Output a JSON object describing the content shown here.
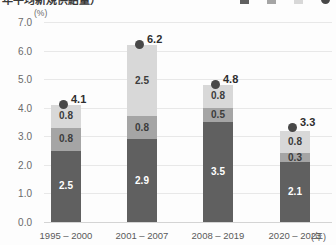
{
  "header": {
    "title_partial": "年平均新規供給量）",
    "unit_label": "(%)",
    "x_axis_unit_label": "(年)"
  },
  "legend": {
    "note": "legend row is cut off at top edge of screenshot; labels not readable",
    "items": [
      {
        "name": "series-bottom",
        "color": "#606060",
        "shape": "square",
        "label": ""
      },
      {
        "name": "series-middle",
        "color": "#a5a5a5",
        "shape": "square",
        "label": ""
      },
      {
        "name": "series-top",
        "color": "#d8d8d8",
        "shape": "square",
        "label": ""
      },
      {
        "name": "series-total",
        "color": "#484848",
        "shape": "circle",
        "label": ""
      }
    ]
  },
  "chart_data": {
    "type": "bar",
    "stacked": true,
    "title": "",
    "xlabel": "(年)",
    "ylabel": "(%)",
    "ylim": [
      0,
      7
    ],
    "ytick_step": 1.0,
    "ytick_labels": [
      "0.0",
      "1.0",
      "2.0",
      "3.0",
      "4.0",
      "5.0",
      "6.0",
      "7.0"
    ],
    "grid": true,
    "legend_position": "top-right",
    "categories": [
      "1995 – 2000",
      "2001 – 2007",
      "2008 – 2019",
      "2020 – 2023"
    ],
    "series": [
      {
        "name": "bottom",
        "color": "#606060",
        "values": [
          2.5,
          2.9,
          3.5,
          2.1
        ]
      },
      {
        "name": "middle",
        "color": "#a5a5a5",
        "values": [
          0.8,
          0.8,
          0.5,
          0.3
        ]
      },
      {
        "name": "top",
        "color": "#d8d8d8",
        "values": [
          0.8,
          2.5,
          0.8,
          0.8
        ]
      }
    ],
    "totals": [
      4.1,
      6.2,
      4.8,
      3.3
    ],
    "total_marker": "dot"
  }
}
